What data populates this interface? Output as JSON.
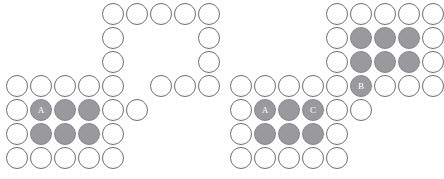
{
  "diagram": {
    "style": {
      "background": "#ffffff",
      "circle_outline": "#6f6f73",
      "circle_empty_fill": "#ffffff",
      "circle_filled_fill": "#9a9a9e",
      "label_color": "#ffffff",
      "cell_size": 22,
      "cell_pitch": 24
    },
    "panels": [
      {
        "name": "left-configuration",
        "origin_x": 6,
        "origin_y": 3,
        "cells": [
          {
            "col": 4,
            "row": 0,
            "filled": false,
            "label": ""
          },
          {
            "col": 5,
            "row": 0,
            "filled": false,
            "label": ""
          },
          {
            "col": 6,
            "row": 0,
            "filled": false,
            "label": ""
          },
          {
            "col": 7,
            "row": 0,
            "filled": false,
            "label": ""
          },
          {
            "col": 8,
            "row": 0,
            "filled": false,
            "label": ""
          },
          {
            "col": 4,
            "row": 1,
            "filled": false,
            "label": ""
          },
          {
            "col": 8,
            "row": 1,
            "filled": false,
            "label": ""
          },
          {
            "col": 4,
            "row": 2,
            "filled": false,
            "label": ""
          },
          {
            "col": 8,
            "row": 2,
            "filled": false,
            "label": ""
          },
          {
            "col": 0,
            "row": 3,
            "filled": false,
            "label": ""
          },
          {
            "col": 1,
            "row": 3,
            "filled": false,
            "label": ""
          },
          {
            "col": 2,
            "row": 3,
            "filled": false,
            "label": ""
          },
          {
            "col": 3,
            "row": 3,
            "filled": false,
            "label": ""
          },
          {
            "col": 4,
            "row": 3,
            "filled": false,
            "label": ""
          },
          {
            "col": 6,
            "row": 3,
            "filled": false,
            "label": ""
          },
          {
            "col": 7,
            "row": 3,
            "filled": false,
            "label": ""
          },
          {
            "col": 8,
            "row": 3,
            "filled": false,
            "label": ""
          },
          {
            "col": 0,
            "row": 4,
            "filled": false,
            "label": ""
          },
          {
            "col": 1,
            "row": 4,
            "filled": true,
            "label": "A"
          },
          {
            "col": 2,
            "row": 4,
            "filled": true,
            "label": ""
          },
          {
            "col": 3,
            "row": 4,
            "filled": true,
            "label": ""
          },
          {
            "col": 4,
            "row": 4,
            "filled": false,
            "label": ""
          },
          {
            "col": 5,
            "row": 4,
            "filled": false,
            "label": ""
          },
          {
            "col": 0,
            "row": 5,
            "filled": false,
            "label": ""
          },
          {
            "col": 1,
            "row": 5,
            "filled": true,
            "label": ""
          },
          {
            "col": 2,
            "row": 5,
            "filled": true,
            "label": ""
          },
          {
            "col": 3,
            "row": 5,
            "filled": true,
            "label": ""
          },
          {
            "col": 4,
            "row": 5,
            "filled": false,
            "label": ""
          },
          {
            "col": 0,
            "row": 6,
            "filled": false,
            "label": ""
          },
          {
            "col": 1,
            "row": 6,
            "filled": false,
            "label": ""
          },
          {
            "col": 2,
            "row": 6,
            "filled": false,
            "label": ""
          },
          {
            "col": 3,
            "row": 6,
            "filled": false,
            "label": ""
          },
          {
            "col": 4,
            "row": 6,
            "filled": false,
            "label": ""
          }
        ]
      },
      {
        "name": "right-configuration",
        "origin_x": 230,
        "origin_y": 3,
        "cells": [
          {
            "col": 4,
            "row": 0,
            "filled": false,
            "label": ""
          },
          {
            "col": 5,
            "row": 0,
            "filled": false,
            "label": ""
          },
          {
            "col": 6,
            "row": 0,
            "filled": false,
            "label": ""
          },
          {
            "col": 7,
            "row": 0,
            "filled": false,
            "label": ""
          },
          {
            "col": 8,
            "row": 0,
            "filled": false,
            "label": ""
          },
          {
            "col": 4,
            "row": 1,
            "filled": false,
            "label": ""
          },
          {
            "col": 5,
            "row": 1,
            "filled": true,
            "label": ""
          },
          {
            "col": 6,
            "row": 1,
            "filled": true,
            "label": ""
          },
          {
            "col": 7,
            "row": 1,
            "filled": true,
            "label": ""
          },
          {
            "col": 8,
            "row": 1,
            "filled": false,
            "label": ""
          },
          {
            "col": 4,
            "row": 2,
            "filled": false,
            "label": ""
          },
          {
            "col": 5,
            "row": 2,
            "filled": true,
            "label": ""
          },
          {
            "col": 6,
            "row": 2,
            "filled": true,
            "label": ""
          },
          {
            "col": 7,
            "row": 2,
            "filled": true,
            "label": ""
          },
          {
            "col": 8,
            "row": 2,
            "filled": false,
            "label": ""
          },
          {
            "col": 0,
            "row": 3,
            "filled": false,
            "label": ""
          },
          {
            "col": 1,
            "row": 3,
            "filled": false,
            "label": ""
          },
          {
            "col": 2,
            "row": 3,
            "filled": false,
            "label": ""
          },
          {
            "col": 3,
            "row": 3,
            "filled": false,
            "label": ""
          },
          {
            "col": 4,
            "row": 3,
            "filled": false,
            "label": ""
          },
          {
            "col": 5,
            "row": 3,
            "filled": true,
            "label": "B"
          },
          {
            "col": 6,
            "row": 3,
            "filled": false,
            "label": ""
          },
          {
            "col": 7,
            "row": 3,
            "filled": false,
            "label": ""
          },
          {
            "col": 8,
            "row": 3,
            "filled": false,
            "label": ""
          },
          {
            "col": 0,
            "row": 4,
            "filled": false,
            "label": ""
          },
          {
            "col": 1,
            "row": 4,
            "filled": true,
            "label": "A"
          },
          {
            "col": 2,
            "row": 4,
            "filled": true,
            "label": ""
          },
          {
            "col": 3,
            "row": 4,
            "filled": true,
            "label": "C"
          },
          {
            "col": 4,
            "row": 4,
            "filled": false,
            "label": ""
          },
          {
            "col": 5,
            "row": 4,
            "filled": false,
            "label": ""
          },
          {
            "col": 0,
            "row": 5,
            "filled": false,
            "label": ""
          },
          {
            "col": 1,
            "row": 5,
            "filled": true,
            "label": ""
          },
          {
            "col": 2,
            "row": 5,
            "filled": true,
            "label": ""
          },
          {
            "col": 3,
            "row": 5,
            "filled": true,
            "label": ""
          },
          {
            "col": 4,
            "row": 5,
            "filled": false,
            "label": ""
          },
          {
            "col": 0,
            "row": 6,
            "filled": false,
            "label": ""
          },
          {
            "col": 1,
            "row": 6,
            "filled": false,
            "label": ""
          },
          {
            "col": 2,
            "row": 6,
            "filled": false,
            "label": ""
          },
          {
            "col": 3,
            "row": 6,
            "filled": false,
            "label": ""
          },
          {
            "col": 4,
            "row": 6,
            "filled": false,
            "label": ""
          }
        ]
      }
    ]
  }
}
